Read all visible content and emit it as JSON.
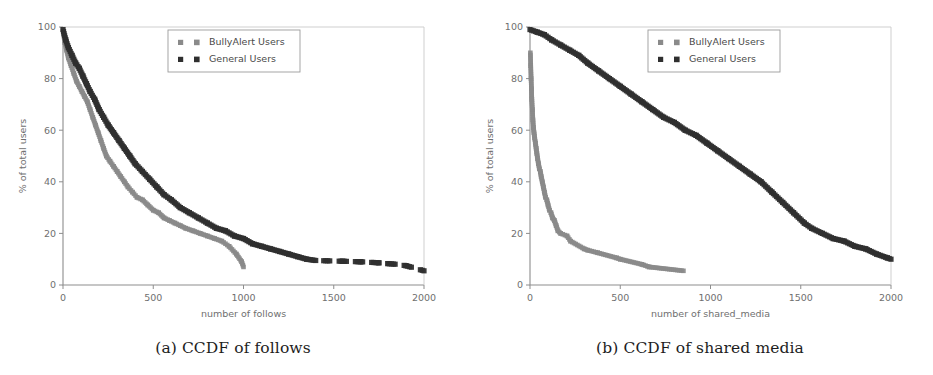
{
  "figure": {
    "background": "#ffffff",
    "panels": [
      "a",
      "b"
    ]
  },
  "colors": {
    "bullyalert": "#8a8a8a",
    "general": "#2f2f2f",
    "axis": "#8d8d8d",
    "tick_text": "#6f6f6f",
    "caption": "#1d1d1d",
    "legend_border": "#9b9b9b"
  },
  "panel_a": {
    "caption": "(a) CCDF of follows",
    "legend": {
      "entries": [
        {
          "label": "BullyAlert Users",
          "marker": "square",
          "color": "#8a8a8a"
        },
        {
          "label": "General Users",
          "marker": "square",
          "color": "#2f2f2f"
        }
      ]
    }
  },
  "panel_b": {
    "caption": "(b) CCDF of shared media",
    "legend": {
      "entries": [
        {
          "label": "BullyAlert Users",
          "marker": "square",
          "color": "#8a8a8a"
        },
        {
          "label": "General Users",
          "marker": "square",
          "color": "#2f2f2f"
        }
      ]
    }
  },
  "chart_data": [
    {
      "id": "ccdf-follows",
      "type": "scatter",
      "title": "(a) CCDF of follows",
      "xlabel": "number of follows",
      "ylabel": "% of total users",
      "xlim": [
        0,
        2000
      ],
      "ylim": [
        0,
        100
      ],
      "xticks": [
        0,
        500,
        1000,
        1500,
        2000
      ],
      "yticks": [
        0,
        20,
        40,
        60,
        80,
        100
      ],
      "grid": false,
      "legend_position": "upper center",
      "series": [
        {
          "name": "BullyAlert Users",
          "color": "#8a8a8a",
          "marker": "square",
          "x": [
            0,
            10,
            20,
            30,
            45,
            60,
            75,
            90,
            105,
            120,
            135,
            150,
            165,
            180,
            195,
            210,
            225,
            240,
            260,
            280,
            300,
            320,
            340,
            360,
            385,
            410,
            440,
            470,
            500,
            530,
            560,
            590,
            620,
            650,
            680,
            720,
            760,
            800,
            840,
            880,
            920,
            960,
            990,
            1000
          ],
          "y": [
            99,
            94,
            91,
            88,
            85,
            82,
            79,
            77,
            75,
            73,
            71,
            68,
            65,
            62,
            59,
            56,
            53,
            50,
            48,
            46,
            44,
            42,
            40,
            38,
            36,
            34,
            33,
            31,
            29,
            28,
            26,
            25,
            24,
            23,
            22,
            21,
            20,
            19,
            18,
            17,
            15,
            12,
            9,
            7
          ]
        },
        {
          "name": "General Users",
          "color": "#2f2f2f",
          "marker": "square",
          "x": [
            0,
            15,
            30,
            50,
            70,
            90,
            110,
            130,
            150,
            175,
            200,
            225,
            250,
            280,
            310,
            340,
            370,
            400,
            440,
            480,
            520,
            560,
            600,
            650,
            700,
            750,
            800,
            850,
            900,
            950,
            1000,
            1050,
            1100,
            1150,
            1200,
            1250,
            1300,
            1350,
            1400,
            1500,
            1550,
            1600,
            1650,
            1700,
            1750,
            1800,
            1850,
            1900,
            1950,
            2000
          ],
          "y": [
            99,
            95,
            92,
            89,
            86,
            84,
            81,
            78,
            75,
            72,
            68,
            65,
            62,
            59,
            56,
            53,
            50,
            47,
            44,
            41,
            38,
            35,
            33,
            30,
            28,
            26,
            24,
            22,
            21,
            19,
            18,
            16,
            15,
            14,
            13,
            12,
            11,
            10,
            9.5,
            9.3,
            9.2,
            9.1,
            9.0,
            8.8,
            8.6,
            8.3,
            8.0,
            7.5,
            6.5,
            5.5
          ]
        }
      ],
      "notes": "General Users tail is sparse/broken between x=1400 and x=2000"
    },
    {
      "id": "ccdf-shared-media",
      "type": "scatter",
      "title": "(b) CCDF of shared media",
      "xlabel": "number of shared_media",
      "ylabel": "% of total users",
      "xlim": [
        0,
        2000
      ],
      "ylim": [
        0,
        100
      ],
      "xticks": [
        0,
        500,
        1000,
        1500,
        2000
      ],
      "yticks": [
        0,
        20,
        40,
        60,
        80,
        100
      ],
      "grid": false,
      "legend_position": "upper center",
      "series": [
        {
          "name": "BullyAlert Users",
          "color": "#8a8a8a",
          "marker": "square",
          "x": [
            2,
            4,
            6,
            8,
            10,
            13,
            16,
            19,
            22,
            26,
            30,
            34,
            38,
            42,
            47,
            52,
            57,
            62,
            68,
            74,
            80,
            86,
            93,
            100,
            108,
            116,
            125,
            135,
            145,
            155,
            170,
            205,
            225,
            300,
            320,
            375,
            480,
            500,
            620,
            660,
            850
          ],
          "y": [
            90,
            85,
            80,
            76,
            72,
            68,
            64,
            61,
            59,
            57,
            55,
            53,
            51,
            49,
            47,
            45,
            44,
            42,
            40,
            38,
            36,
            34,
            33,
            31,
            29,
            28,
            26,
            25,
            23,
            21,
            20,
            19,
            17,
            14,
            13.5,
            12.5,
            10.5,
            10,
            8,
            7,
            5.5
          ]
        },
        {
          "name": "General Users",
          "color": "#2f2f2f",
          "marker": "square",
          "x": [
            0,
            40,
            80,
            120,
            170,
            220,
            270,
            320,
            380,
            440,
            500,
            560,
            620,
            680,
            740,
            800,
            860,
            920,
            980,
            1040,
            1100,
            1160,
            1220,
            1280,
            1340,
            1400,
            1460,
            1520,
            1560,
            1620,
            1680,
            1740,
            1800,
            1860,
            1920,
            1980,
            2000
          ],
          "y": [
            99,
            98,
            97,
            95,
            93,
            91,
            89,
            86,
            83,
            80,
            77,
            74,
            71,
            68,
            65,
            63,
            60,
            58,
            55,
            52,
            49,
            46,
            43,
            40,
            36,
            32,
            28,
            24,
            22,
            20,
            18,
            17,
            15,
            14,
            12,
            10.5,
            10
          ]
        }
      ]
    }
  ]
}
